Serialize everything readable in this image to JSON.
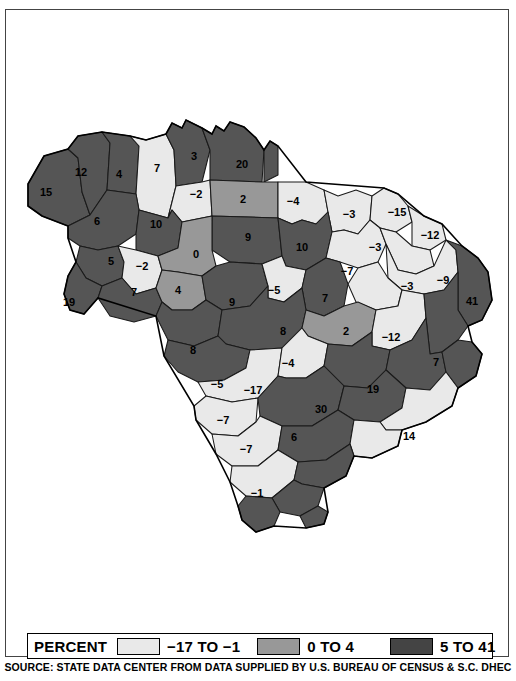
{
  "map": {
    "title": "South Carolina Percent Change by County",
    "colors": {
      "low": "#e9e9e9",
      "mid": "#989898",
      "high": "#555555",
      "outline": "#1a1a1a",
      "background": "#ffffff"
    },
    "counties": [
      {
        "label": "15",
        "class": "high",
        "x": 40,
        "y": 183
      },
      {
        "label": "12",
        "class": "high",
        "x": 75,
        "y": 163
      },
      {
        "label": "4",
        "class": "high",
        "x": 113,
        "y": 165
      },
      {
        "label": "7",
        "class": "high",
        "x": 151,
        "y": 159
      },
      {
        "label": "3",
        "class": "high",
        "x": 188,
        "y": 147
      },
      {
        "label": "20",
        "class": "high",
        "x": 236,
        "y": 155
      },
      {
        "label": "-2",
        "class": "low",
        "x": 190,
        "y": 185
      },
      {
        "label": "2",
        "class": "mid",
        "x": 237,
        "y": 190
      },
      {
        "label": "-4",
        "class": "low",
        "x": 287,
        "y": 192
      },
      {
        "label": "-3",
        "class": "low",
        "x": 343,
        "y": 205
      },
      {
        "label": "-15",
        "class": "low",
        "x": 391,
        "y": 203
      },
      {
        "label": "6",
        "class": "high",
        "x": 91,
        "y": 212
      },
      {
        "label": "10",
        "class": "high",
        "x": 150,
        "y": 215
      },
      {
        "label": "9",
        "class": "high",
        "x": 242,
        "y": 228
      },
      {
        "label": "10",
        "class": "high",
        "x": 296,
        "y": 238
      },
      {
        "label": "-3",
        "class": "low",
        "x": 369,
        "y": 238
      },
      {
        "label": "-12",
        "class": "low",
        "x": 424,
        "y": 226
      },
      {
        "label": "5",
        "class": "high",
        "x": 105,
        "y": 252
      },
      {
        "label": "-2",
        "class": "low",
        "x": 136,
        "y": 257
      },
      {
        "label": "0",
        "class": "mid",
        "x": 190,
        "y": 245
      },
      {
        "label": "-7",
        "class": "low",
        "x": 341,
        "y": 262
      },
      {
        "label": "-3",
        "class": "low",
        "x": 401,
        "y": 277
      },
      {
        "label": "-9",
        "class": "low",
        "x": 437,
        "y": 271
      },
      {
        "label": "41",
        "class": "high",
        "x": 466,
        "y": 292
      },
      {
        "label": "19",
        "class": "high",
        "x": 63,
        "y": 293
      },
      {
        "label": "7",
        "class": "high",
        "x": 128,
        "y": 283
      },
      {
        "label": "4",
        "class": "mid",
        "x": 172,
        "y": 281
      },
      {
        "label": "9",
        "class": "high",
        "x": 226,
        "y": 293
      },
      {
        "label": "-5",
        "class": "low",
        "x": 268,
        "y": 281
      },
      {
        "label": "7",
        "class": "high",
        "x": 319,
        "y": 289
      },
      {
        "label": "8",
        "class": "high",
        "x": 277,
        "y": 322
      },
      {
        "label": "2",
        "class": "mid",
        "x": 340,
        "y": 322
      },
      {
        "label": "-12",
        "class": "low",
        "x": 385,
        "y": 328
      },
      {
        "label": "8",
        "class": "high",
        "x": 187,
        "y": 341
      },
      {
        "label": "-4",
        "class": "low",
        "x": 282,
        "y": 354
      },
      {
        "label": "7",
        "class": "high",
        "x": 430,
        "y": 353
      },
      {
        "label": "-5",
        "class": "low",
        "x": 211,
        "y": 375
      },
      {
        "label": "-17",
        "class": "low",
        "x": 247,
        "y": 381
      },
      {
        "label": "19",
        "class": "high",
        "x": 367,
        "y": 380
      },
      {
        "label": "30",
        "class": "high",
        "x": 315,
        "y": 400
      },
      {
        "label": "-7",
        "class": "low",
        "x": 217,
        "y": 411
      },
      {
        "label": "6",
        "class": "high",
        "x": 288,
        "y": 428
      },
      {
        "label": "14",
        "class": "low",
        "x": 403,
        "y": 427
      },
      {
        "label": "-7",
        "class": "low",
        "x": 240,
        "y": 440
      },
      {
        "label": "-1",
        "class": "low",
        "x": 251,
        "y": 484
      }
    ]
  },
  "legend": {
    "title": "PERCENT",
    "entries": [
      {
        "swatch": "low",
        "label": "−17 TO  −1"
      },
      {
        "swatch": "mid",
        "label": "0 TO 4"
      },
      {
        "swatch": "high",
        "label": "5 TO 41"
      }
    ]
  },
  "source": {
    "text": "SOURCE: STATE DATA CENTER FROM DATA SUPPLIED BY U.S. BUREAU OF CENSUS & S.C. DHEC"
  },
  "chart_data": {
    "type": "map",
    "value_unit": "percent",
    "classes": [
      {
        "name": "-17 TO -1",
        "min": -17,
        "max": -1,
        "color": "#e9e9e9"
      },
      {
        "name": "0 TO 4",
        "min": 0,
        "max": 4,
        "color": "#989898"
      },
      {
        "name": "5 TO 41",
        "min": 5,
        "max": 41,
        "color": "#555555"
      }
    ],
    "values": [
      15,
      12,
      4,
      7,
      3,
      20,
      -2,
      2,
      -4,
      -3,
      -15,
      6,
      10,
      9,
      10,
      -3,
      -12,
      5,
      -2,
      0,
      -7,
      -3,
      -9,
      41,
      19,
      7,
      4,
      9,
      -5,
      7,
      8,
      2,
      -12,
      8,
      -4,
      7,
      -5,
      -17,
      19,
      30,
      -7,
      6,
      14,
      -7,
      -1
    ],
    "value_range": [
      -17,
      41
    ],
    "legend_position": "bottom",
    "source": "SOURCE: STATE DATA CENTER FROM DATA SUPPLIED BY U.S. BUREAU OF CENSUS & S.C. DHEC"
  }
}
